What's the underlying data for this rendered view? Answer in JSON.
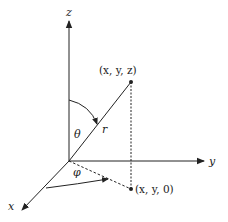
{
  "diagram": {
    "axes": {
      "x": {
        "label": "x"
      },
      "y": {
        "label": "y"
      },
      "z": {
        "label": "z"
      }
    },
    "points": {
      "p": {
        "label": "(x, y, z)"
      },
      "projection": {
        "label": "(x, y, 0)"
      }
    },
    "symbols": {
      "radius": "r",
      "polar_angle": "θ",
      "azimuth_angle": "φ"
    },
    "colors": {
      "stroke": "#222222",
      "background": "#ffffff"
    }
  }
}
